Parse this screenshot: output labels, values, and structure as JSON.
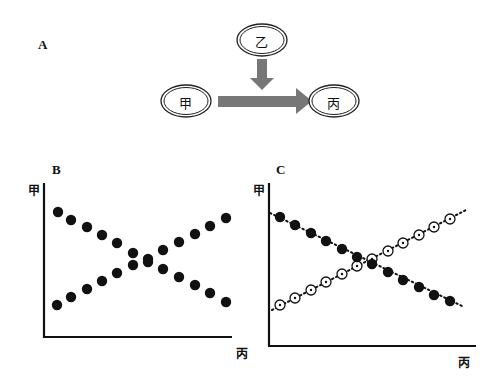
{
  "panels": {
    "A": {
      "label": "A",
      "nodes": [
        {
          "id": "jia",
          "text": "甲",
          "cx": 186,
          "cy": 101
        },
        {
          "id": "yi",
          "text": "乙",
          "cx": 262,
          "cy": 40
        },
        {
          "id": "bing",
          "text": "丙",
          "cx": 334,
          "cy": 101
        }
      ],
      "arrows": [
        {
          "from": "jia",
          "to": "bing",
          "desc": "甲 → 丙"
        },
        {
          "from": "yi",
          "to": "jia-bing-arrow",
          "desc": "乙 acts on the 甲→丙 pathway"
        }
      ]
    },
    "B": {
      "label": "B",
      "y_label": "甲",
      "x_label": "丙"
    },
    "C": {
      "label": "C",
      "y_label": "甲",
      "x_label": "丙"
    }
  },
  "colors": {
    "arrow": "#777777",
    "dot": "#111111",
    "axis": "#111111"
  },
  "chart_data": [
    {
      "panel": "B",
      "type": "scatter",
      "title": "",
      "xlabel": "丙",
      "ylabel": "甲",
      "grid": false,
      "legend": "none",
      "series": [
        {
          "name": "decreasing",
          "marker": "filled-circle",
          "points": [
            [
              58,
              212
            ],
            [
              71,
              220
            ],
            [
              87,
              227
            ],
            [
              102,
              235
            ],
            [
              117,
              243
            ],
            [
              133,
              253
            ],
            [
              148,
              259
            ],
            [
              163,
              269
            ],
            [
              179,
              277
            ],
            [
              195,
              285
            ],
            [
              210,
              293
            ],
            [
              226,
              302
            ]
          ]
        },
        {
          "name": "increasing",
          "marker": "filled-circle",
          "points": [
            [
              57,
              305
            ],
            [
              71,
              297
            ],
            [
              87,
              289
            ],
            [
              102,
              281
            ],
            [
              117,
              273
            ],
            [
              133,
              265
            ],
            [
              148,
              262
            ],
            [
              163,
              250
            ],
            [
              179,
              242
            ],
            [
              195,
              234
            ],
            [
              210,
              226
            ],
            [
              226,
              218
            ]
          ]
        }
      ]
    },
    {
      "panel": "C",
      "type": "scatter",
      "title": "",
      "xlabel": "丙",
      "ylabel": "甲",
      "grid": false,
      "legend": "none",
      "series": [
        {
          "name": "decreasing",
          "marker": "filled-circle",
          "trendline": "dotted",
          "points": [
            [
              280,
              217
            ],
            [
              295,
              225
            ],
            [
              311,
              233
            ],
            [
              326,
              241
            ],
            [
              342,
              249
            ],
            [
              357,
              257
            ],
            [
              372,
              264
            ],
            [
              388,
              272
            ],
            [
              403,
              280
            ],
            [
              419,
              287
            ],
            [
              434,
              295
            ],
            [
              450,
              301
            ]
          ],
          "line": [
            [
              270,
              213
            ],
            [
              462,
              306
            ]
          ]
        },
        {
          "name": "increasing",
          "marker": "open-circle-dot",
          "trendline": "dotted",
          "points": [
            [
              280,
              305
            ],
            [
              295,
              298
            ],
            [
              311,
              290
            ],
            [
              326,
              282
            ],
            [
              342,
              274
            ],
            [
              357,
              266
            ],
            [
              372,
              259
            ],
            [
              388,
              251
            ],
            [
              403,
              243
            ],
            [
              419,
              235
            ],
            [
              434,
              227
            ],
            [
              450,
              219
            ]
          ],
          "line": [
            [
              272,
              310
            ],
            [
              468,
              209
            ]
          ]
        }
      ]
    }
  ]
}
